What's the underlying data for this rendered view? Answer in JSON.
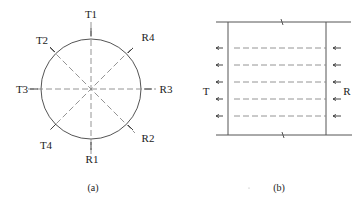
{
  "figure_a": {
    "caption": "(a)",
    "shape": "circle",
    "center": [
      91,
      89
    ],
    "radius": 50,
    "labels": {
      "T1": "T1",
      "T2": "T2",
      "T3": "T3",
      "T4": "T4",
      "R1": "R1",
      "R2": "R2",
      "R3": "R3",
      "R4": "R4"
    },
    "paths": [
      {
        "from": "T1",
        "to": "R1",
        "direction": "vertical"
      },
      {
        "from": "T3",
        "to": "R3",
        "direction": "horizontal"
      },
      {
        "from": "T2",
        "to": "R2",
        "direction": "diagonal"
      },
      {
        "from": "T4",
        "to": "R4",
        "direction": "diagonal"
      }
    ]
  },
  "figure_b": {
    "caption": "(b)",
    "transmitter_label": "T",
    "receiver_label": "R",
    "ray_count": 5,
    "ray_y": [
      48,
      65,
      82,
      99,
      116
    ],
    "colors": {
      "line": "#555555",
      "dash": "#888888",
      "text": "#222222"
    }
  }
}
